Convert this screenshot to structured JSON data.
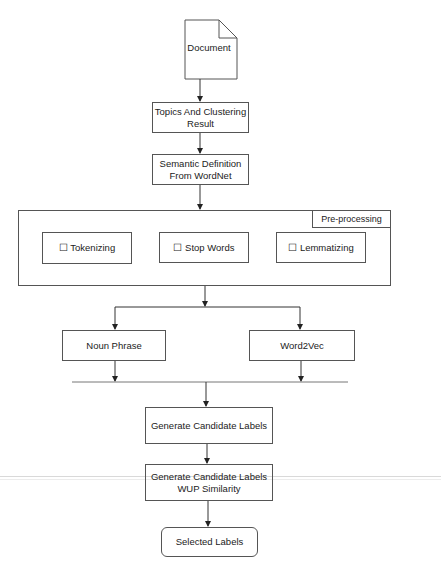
{
  "diagram": {
    "type": "flowchart",
    "nodes": {
      "document": {
        "label": "Document",
        "shape": "document"
      },
      "topics": {
        "label": "Topics And Clustering Result",
        "line1": "Topics And Clustering",
        "line2": "Result"
      },
      "semantic": {
        "label": "Semantic Definition From WordNet",
        "line1": "Semantic Definition",
        "line2": "From WordNet"
      },
      "preprocessing": {
        "title": "Pre-processing",
        "steps": [
          {
            "label": "☐ Tokenizing"
          },
          {
            "label": "☐ Stop Words"
          },
          {
            "label": "☐  Lemmatizing"
          }
        ]
      },
      "noun_phrase": {
        "label": "Noun Phrase"
      },
      "word2vec": {
        "label": "Word2Vec"
      },
      "generate": {
        "label": "Generate Candidate Labels"
      },
      "wup": {
        "label": "Generate Candidate Labels WUP Similarity",
        "line1": "Generate Candidate Labels",
        "line2": "WUP Similarity"
      },
      "selected": {
        "label": "Selected Labels",
        "shape": "rounded"
      }
    },
    "edges": [
      [
        "Document",
        "Topics And Clustering Result"
      ],
      [
        "Topics And Clustering Result",
        "Semantic Definition From WordNet"
      ],
      [
        "Semantic Definition From WordNet",
        "Pre-processing"
      ],
      [
        "Pre-processing",
        "Noun Phrase"
      ],
      [
        "Pre-processing",
        "Word2Vec"
      ],
      [
        "Noun Phrase",
        "merge"
      ],
      [
        "Word2Vec",
        "merge"
      ],
      [
        "merge",
        "Generate Candidate Labels"
      ],
      [
        "Generate Candidate Labels",
        "Generate Candidate Labels WUP Similarity"
      ],
      [
        "Generate Candidate Labels WUP Similarity",
        "Selected Labels"
      ]
    ],
    "colors": {
      "stroke": "#555555",
      "text": "#222222",
      "background": "#ffffff"
    }
  }
}
